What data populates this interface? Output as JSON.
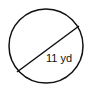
{
  "diagram": {
    "shape": "circle",
    "segment": "diameter",
    "label": "11 yd",
    "stroke_color": "#111111",
    "background": "#ffffff"
  }
}
